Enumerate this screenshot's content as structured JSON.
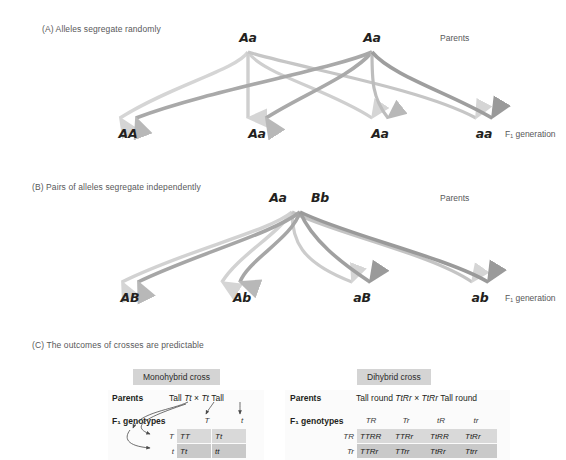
{
  "figure": {
    "panels": [
      {
        "id": "A",
        "title": "(A) Alleles segregate randomly",
        "parents_label": "Parents",
        "f1_label": "F₁ generation",
        "parents": [
          "Aa",
          "Aa"
        ],
        "offspring": [
          "AA",
          "Aa",
          "Aa",
          "aa"
        ]
      },
      {
        "id": "B",
        "title": "(B) Pairs of alleles segregate independently",
        "parents_label": "Parents",
        "f1_label": "F₁ generation",
        "parents": [
          "Aa",
          "Bb"
        ],
        "offspring": [
          "AB",
          "Ab",
          "aB",
          "ab"
        ]
      },
      {
        "id": "C",
        "title": "(C) The outcomes of crosses are predictable"
      }
    ]
  },
  "monohybrid": {
    "chip": "Monohybrid cross",
    "parents_row_label": "Parents",
    "genotypes_row_label": "F₁ genotypes",
    "parents_text_left": "Tall",
    "parents_geno_left": "Tt",
    "parents_cross_symbol": "×",
    "parents_geno_right": "Tt",
    "parents_text_right": "Tall",
    "col_headers": [
      "T",
      "t"
    ],
    "row_headers": [
      "T",
      "t"
    ],
    "cells": [
      [
        "TT",
        "Tt"
      ],
      [
        "Tt",
        "tt"
      ]
    ]
  },
  "dihybrid": {
    "chip": "Dihybrid cross",
    "parents_row_label": "Parents",
    "genotypes_row_label": "F₁ genotypes",
    "parents_text_left": "Tall round",
    "parents_geno_left": "TtRr",
    "parents_cross_symbol": "×",
    "parents_geno_right": "TtRr",
    "parents_text_right": "Tall round",
    "col_headers": [
      "TR",
      "Tr",
      "tR",
      "tr"
    ],
    "row_headers": [
      "TR",
      "Tr"
    ],
    "cells": [
      [
        "TTRR",
        "TTRr",
        "TtRR",
        "TtRr"
      ],
      [
        "TTRr",
        "TTrr",
        "TtRr",
        "Ttrr"
      ]
    ]
  },
  "colors": {
    "chip_bg": "#d4d4d4",
    "text": "#231f20",
    "muted": "#58585a",
    "arrow_light": "#d5d5d5",
    "arrow_mid": "#b8b8b8",
    "arrow_dark": "#8e8e8e"
  }
}
